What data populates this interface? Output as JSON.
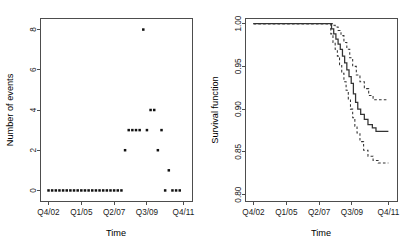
{
  "figure": {
    "background": "#ffffff",
    "foreground": "#1a1a1a",
    "width": 419,
    "height": 246
  },
  "chart_data": [
    {
      "type": "scatter",
      "panel": "left",
      "title": "",
      "xlabel": "Time",
      "ylabel": "Number of events",
      "xtick_labels": [
        "Q4/02",
        "Q1/05",
        "Q2/07",
        "Q3/09",
        "Q4/11"
      ],
      "xtick_values": [
        0,
        9,
        18,
        27,
        37
      ],
      "ytick_labels": [
        "0",
        "2",
        "4",
        "6",
        "8"
      ],
      "ytick_values": [
        0,
        2,
        4,
        6,
        8
      ],
      "xlim": [
        -2.2,
        39.5
      ],
      "ylim": [
        -0.55,
        8.55
      ],
      "grid": false,
      "legend": "none",
      "marker": "filled-square",
      "points": [
        {
          "x": 0,
          "y": 0
        },
        {
          "x": 1,
          "y": 0
        },
        {
          "x": 2,
          "y": 0
        },
        {
          "x": 3,
          "y": 0
        },
        {
          "x": 4,
          "y": 0
        },
        {
          "x": 5,
          "y": 0
        },
        {
          "x": 6,
          "y": 0
        },
        {
          "x": 7,
          "y": 0
        },
        {
          "x": 8,
          "y": 0
        },
        {
          "x": 9,
          "y": 0
        },
        {
          "x": 10,
          "y": 0
        },
        {
          "x": 11,
          "y": 0
        },
        {
          "x": 12,
          "y": 0
        },
        {
          "x": 13,
          "y": 0
        },
        {
          "x": 14,
          "y": 0
        },
        {
          "x": 15,
          "y": 0
        },
        {
          "x": 16,
          "y": 0
        },
        {
          "x": 17,
          "y": 0
        },
        {
          "x": 18,
          "y": 0
        },
        {
          "x": 19,
          "y": 0
        },
        {
          "x": 20,
          "y": 0
        },
        {
          "x": 21,
          "y": 2
        },
        {
          "x": 22,
          "y": 3
        },
        {
          "x": 23,
          "y": 3
        },
        {
          "x": 24,
          "y": 3
        },
        {
          "x": 25,
          "y": 3
        },
        {
          "x": 26,
          "y": 8
        },
        {
          "x": 27,
          "y": 3
        },
        {
          "x": 28,
          "y": 4
        },
        {
          "x": 29,
          "y": 4
        },
        {
          "x": 30,
          "y": 2
        },
        {
          "x": 31,
          "y": 3
        },
        {
          "x": 32,
          "y": 0
        },
        {
          "x": 33,
          "y": 1
        },
        {
          "x": 34,
          "y": 0
        },
        {
          "x": 35,
          "y": 0
        },
        {
          "x": 36,
          "y": 0
        }
      ]
    },
    {
      "type": "line",
      "panel": "right",
      "title": "",
      "xlabel": "Time",
      "ylabel": "Survival function",
      "xtick_labels": [
        "Q4/02",
        "Q1/05",
        "Q2/07",
        "Q3/09",
        "Q4/11"
      ],
      "xtick_values": [
        0,
        9,
        18,
        27,
        37
      ],
      "ytick_labels": [
        "0.80",
        "0.85",
        "0.90",
        "0.95",
        "1.00"
      ],
      "ytick_values": [
        0.8,
        0.85,
        0.9,
        0.95,
        1.0
      ],
      "xlim": [
        -2.2,
        39.5
      ],
      "ylim": [
        0.792,
        1.006
      ],
      "grid": false,
      "legend": "none",
      "style": "kaplan-meier-step",
      "series": [
        {
          "name": "Survival estimate",
          "linestyle": "solid",
          "step": [
            {
              "x": 0.0,
              "y": 1.0
            },
            {
              "x": 21.0,
              "y": 1.0
            },
            {
              "x": 21.4,
              "y": 0.994
            },
            {
              "x": 22.0,
              "y": 0.988
            },
            {
              "x": 22.6,
              "y": 0.982
            },
            {
              "x": 23.2,
              "y": 0.976
            },
            {
              "x": 23.8,
              "y": 0.97
            },
            {
              "x": 24.4,
              "y": 0.962
            },
            {
              "x": 25.0,
              "y": 0.954
            },
            {
              "x": 25.6,
              "y": 0.946
            },
            {
              "x": 26.2,
              "y": 0.938
            },
            {
              "x": 26.8,
              "y": 0.93
            },
            {
              "x": 27.4,
              "y": 0.918
            },
            {
              "x": 28.0,
              "y": 0.908
            },
            {
              "x": 28.6,
              "y": 0.9
            },
            {
              "x": 29.4,
              "y": 0.894
            },
            {
              "x": 30.4,
              "y": 0.888
            },
            {
              "x": 31.4,
              "y": 0.882
            },
            {
              "x": 32.6,
              "y": 0.878
            },
            {
              "x": 33.6,
              "y": 0.874
            },
            {
              "x": 37.0,
              "y": 0.874
            }
          ]
        },
        {
          "name": "Upper 95% confidence limit",
          "linestyle": "dashed",
          "step": [
            {
              "x": 0.0,
              "y": 1.0
            },
            {
              "x": 21.0,
              "y": 1.0
            },
            {
              "x": 21.6,
              "y": 0.998
            },
            {
              "x": 22.4,
              "y": 0.996
            },
            {
              "x": 23.2,
              "y": 0.992
            },
            {
              "x": 24.0,
              "y": 0.986
            },
            {
              "x": 24.8,
              "y": 0.978
            },
            {
              "x": 25.6,
              "y": 0.97
            },
            {
              "x": 26.4,
              "y": 0.96
            },
            {
              "x": 27.2,
              "y": 0.95
            },
            {
              "x": 28.2,
              "y": 0.94
            },
            {
              "x": 29.2,
              "y": 0.932
            },
            {
              "x": 30.4,
              "y": 0.924
            },
            {
              "x": 31.6,
              "y": 0.916
            },
            {
              "x": 32.8,
              "y": 0.911
            },
            {
              "x": 37.0,
              "y": 0.911
            }
          ]
        },
        {
          "name": "Lower 95% confidence limit",
          "linestyle": "dashed",
          "step": [
            {
              "x": 0.0,
              "y": 1.0
            },
            {
              "x": 21.0,
              "y": 1.0
            },
            {
              "x": 21.2,
              "y": 0.988
            },
            {
              "x": 21.8,
              "y": 0.978
            },
            {
              "x": 22.4,
              "y": 0.97
            },
            {
              "x": 23.0,
              "y": 0.962
            },
            {
              "x": 23.6,
              "y": 0.952
            },
            {
              "x": 24.2,
              "y": 0.942
            },
            {
              "x": 24.8,
              "y": 0.932
            },
            {
              "x": 25.4,
              "y": 0.922
            },
            {
              "x": 26.0,
              "y": 0.912
            },
            {
              "x": 26.6,
              "y": 0.9
            },
            {
              "x": 27.2,
              "y": 0.89
            },
            {
              "x": 27.8,
              "y": 0.88
            },
            {
              "x": 28.4,
              "y": 0.872
            },
            {
              "x": 29.2,
              "y": 0.862
            },
            {
              "x": 30.2,
              "y": 0.852
            },
            {
              "x": 31.4,
              "y": 0.845
            },
            {
              "x": 32.8,
              "y": 0.84
            },
            {
              "x": 34.2,
              "y": 0.837
            },
            {
              "x": 37.0,
              "y": 0.837
            }
          ]
        }
      ]
    }
  ]
}
